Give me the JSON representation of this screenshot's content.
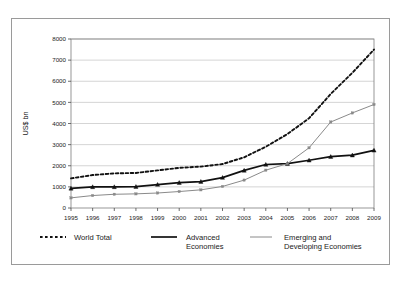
{
  "chart_data": {
    "type": "line",
    "title": "",
    "xlabel": "",
    "ylabel": "US$ bn",
    "x": [
      1995,
      1996,
      1997,
      1998,
      1999,
      2000,
      2001,
      2002,
      2003,
      2004,
      2005,
      2006,
      2007,
      2008,
      2009
    ],
    "xticklabels": [
      "1995",
      "1996",
      "1997",
      "1998",
      "1999",
      "2000",
      "2001",
      "2002",
      "2003",
      "2004",
      "2005",
      "2006",
      "2007",
      "2008",
      "2009"
    ],
    "yticklabels": [
      "0",
      "1000",
      "2000",
      "3000",
      "4000",
      "5000",
      "6000",
      "7000",
      "8000"
    ],
    "ylim": [
      0,
      8000
    ],
    "ytick_step": 1000,
    "grid": "horizontal",
    "legend_position": "bottom",
    "series": [
      {
        "name": "World Total",
        "style": "dashed",
        "color": "#111111",
        "width": 1.9,
        "marker": "none",
        "values": [
          1400,
          1560,
          1640,
          1660,
          1780,
          1900,
          1960,
          2080,
          2400,
          2900,
          3500,
          4250,
          5400,
          6400,
          7500
        ]
      },
      {
        "name": "Advanced Economies",
        "style": "solid",
        "color": "#111111",
        "width": 1.7,
        "marker": "triangle",
        "values": [
          930,
          1000,
          1000,
          1010,
          1110,
          1200,
          1250,
          1440,
          1780,
          2060,
          2100,
          2260,
          2430,
          2500,
          2730
        ]
      },
      {
        "name": "Emerging and Developing Economies",
        "style": "solid",
        "color": "#8a8a8a",
        "width": 1.0,
        "marker": "square",
        "values": [
          480,
          590,
          650,
          670,
          710,
          780,
          860,
          1020,
          1320,
          1790,
          2100,
          2850,
          4070,
          4500,
          4900
        ]
      }
    ],
    "legend": [
      {
        "label_line1": "World Total",
        "label_line2": "",
        "swatch": "dashed-thick-black"
      },
      {
        "label_line1": "Advanced",
        "label_line2": "Economies",
        "swatch": "solid-thick-black"
      },
      {
        "label_line1": "Emerging and",
        "label_line2": "Developing Economies",
        "swatch": "solid-thin-gray"
      }
    ]
  },
  "colors": {
    "world_total": "#111111",
    "advanced": "#111111",
    "emerging": "#8a8a8a",
    "grid": "#b8b8b8",
    "frame": "#7d7d7d",
    "outer_border": "#9a9a9a",
    "background": "#ffffff"
  }
}
